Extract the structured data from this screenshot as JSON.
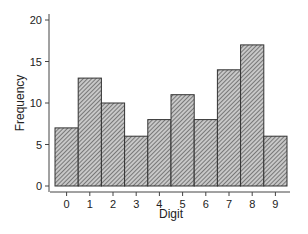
{
  "chart_data": {
    "type": "bar",
    "title": "",
    "xlabel": "Digit",
    "ylabel": "Frequency",
    "categories": [
      "0",
      "1",
      "2",
      "3",
      "4",
      "5",
      "6",
      "7",
      "8",
      "9"
    ],
    "values": [
      7,
      13,
      10,
      6,
      8,
      11,
      8,
      14,
      17,
      6
    ],
    "ylim": [
      0,
      20
    ],
    "yticks": [
      0,
      5,
      10,
      15,
      20
    ],
    "grid": false,
    "legend": null,
    "bar_style": {
      "fill": "#b0b0b0",
      "hatch": "diagonal",
      "edge": "#333333"
    }
  }
}
